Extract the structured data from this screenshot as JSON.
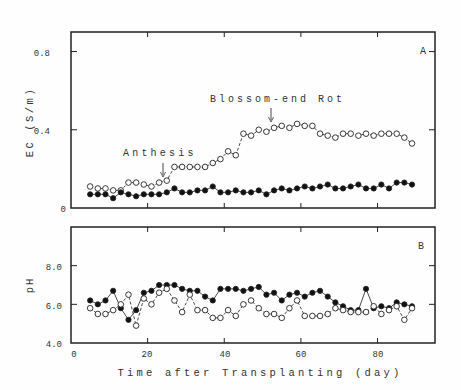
{
  "chart_data": [
    {
      "type": "line",
      "panel_label": "A",
      "title": "",
      "xlabel": "Time after Transplanting (day)",
      "ylabel": "EC (S/m)",
      "xlim": [
        0,
        95
      ],
      "ylim": [
        0,
        0.9
      ],
      "xticks": [
        0,
        20,
        40,
        60,
        80
      ],
      "yticks": [
        0,
        0.4,
        0.8
      ],
      "ytick_labels": [
        "0",
        "0.4",
        "0.8"
      ],
      "grid": false,
      "annotations": [
        {
          "text": "Anthesis",
          "x": 24,
          "y": 0.14,
          "arrow": true
        },
        {
          "text": "Blossom-end Rot",
          "x": 53,
          "y": 0.42,
          "arrow": true
        }
      ],
      "x": [
        5,
        7,
        9,
        11,
        13,
        15,
        17,
        19,
        21,
        23,
        25,
        27,
        29,
        31,
        33,
        35,
        37,
        39,
        41,
        43,
        45,
        47,
        49,
        51,
        53,
        55,
        57,
        59,
        61,
        63,
        65,
        67,
        69,
        71,
        73,
        75,
        77,
        79,
        81,
        83,
        85,
        87,
        89
      ],
      "series": [
        {
          "name": "open circles (blossom-end rot treatment)",
          "marker": "open-circle",
          "line": "dashed",
          "values": [
            0.11,
            0.1,
            0.1,
            0.09,
            0.09,
            0.13,
            0.13,
            0.12,
            0.11,
            0.13,
            0.14,
            0.21,
            0.21,
            0.21,
            0.21,
            0.21,
            0.23,
            0.25,
            0.29,
            0.27,
            0.38,
            0.37,
            0.4,
            0.39,
            0.41,
            0.42,
            0.41,
            0.43,
            0.42,
            0.42,
            0.38,
            0.37,
            0.36,
            0.38,
            0.38,
            0.37,
            0.38,
            0.37,
            0.38,
            0.38,
            0.38,
            0.36,
            0.33,
            0.36,
            0.4,
            0.4
          ]
        },
        {
          "name": "filled circles (control)",
          "marker": "filled-circle",
          "line": "solid",
          "values": [
            0.07,
            0.07,
            0.07,
            0.05,
            0.08,
            0.07,
            0.06,
            0.07,
            0.07,
            0.07,
            0.08,
            0.1,
            0.08,
            0.08,
            0.09,
            0.09,
            0.11,
            0.08,
            0.08,
            0.09,
            0.08,
            0.08,
            0.09,
            0.07,
            0.09,
            0.1,
            0.09,
            0.1,
            0.11,
            0.1,
            0.11,
            0.12,
            0.1,
            0.1,
            0.11,
            0.12,
            0.1,
            0.1,
            0.12,
            0.1,
            0.13,
            0.13,
            0.12,
            0.13,
            0.14
          ]
        }
      ]
    },
    {
      "type": "line",
      "panel_label": "B",
      "title": "",
      "xlabel": "Time after Transplanting (day)",
      "ylabel": "pH",
      "xlim": [
        0,
        95
      ],
      "ylim": [
        4.0,
        10.0
      ],
      "xticks": [
        0,
        20,
        40,
        60,
        80
      ],
      "yticks": [
        4.0,
        6.0,
        8.0
      ],
      "ytick_labels": [
        "4.0",
        "6.0",
        "8.0"
      ],
      "grid": false,
      "x": [
        5,
        7,
        9,
        11,
        13,
        15,
        17,
        19,
        21,
        23,
        25,
        27,
        29,
        31,
        33,
        35,
        37,
        39,
        41,
        43,
        45,
        47,
        49,
        51,
        53,
        55,
        57,
        59,
        61,
        63,
        65,
        67,
        69,
        71,
        73,
        75,
        77,
        79,
        81,
        83,
        85,
        87,
        89
      ],
      "series": [
        {
          "name": "filled circles (control)",
          "marker": "filled-circle",
          "line": "solid",
          "values": [
            6.2,
            6.0,
            6.2,
            6.7,
            5.8,
            5.2,
            5.7,
            6.6,
            6.7,
            7.0,
            7.0,
            7.0,
            6.8,
            6.7,
            6.7,
            6.4,
            6.2,
            6.8,
            6.8,
            6.8,
            6.7,
            6.8,
            6.9,
            6.5,
            6.6,
            6.2,
            6.5,
            6.6,
            6.4,
            6.6,
            6.7,
            6.4,
            6.1,
            5.9,
            5.7,
            5.7,
            6.8,
            5.8,
            5.9,
            5.8,
            6.1,
            6.0,
            5.9,
            6.2
          ]
        },
        {
          "name": "open circles (blossom-end rot treatment)",
          "marker": "open-circle",
          "line": "dashed",
          "values": [
            5.8,
            5.5,
            5.5,
            5.7,
            6.0,
            6.5,
            4.9,
            6.3,
            6.0,
            6.6,
            6.8,
            6.2,
            5.6,
            6.5,
            5.7,
            5.7,
            5.3,
            5.3,
            5.7,
            5.4,
            6.0,
            6.2,
            5.8,
            5.5,
            5.5,
            5.3,
            5.8,
            6.2,
            5.4,
            5.4,
            5.4,
            5.5,
            5.8,
            5.7,
            5.6,
            5.6,
            5.6,
            5.9,
            5.5,
            5.7,
            5.9,
            5.2,
            5.8
          ]
        }
      ]
    }
  ],
  "figure": {
    "panel_a_label": "A",
    "panel_b_label": "B",
    "x_axis_title": "Time after Transplanting  (day)",
    "panel_a_ylabel": "EC (S/m)",
    "panel_b_ylabel": "pH",
    "x_tick_labels": [
      "0",
      "20",
      "40",
      "60",
      "80"
    ],
    "panel_a_ytick_labels": [
      "0",
      "0.8",
      "0.4"
    ],
    "panel_b_ytick_labels": [
      "8.0",
      "6.0",
      "4.0"
    ],
    "annotation_anthesis": "Anthesis",
    "annotation_ber": "Blossom-end Rot"
  }
}
